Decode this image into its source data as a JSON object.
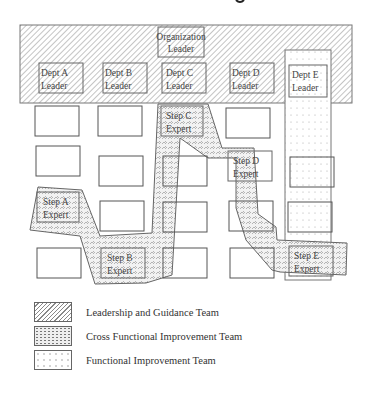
{
  "diagram": {
    "organization_leader": {
      "line1": "Organization",
      "line2": "Leader"
    },
    "dept_leaders": [
      {
        "id": "A",
        "line1": "Dept A",
        "line2": "Leader"
      },
      {
        "id": "B",
        "line1": "Dept B",
        "line2": "Leader"
      },
      {
        "id": "C",
        "line1": "Dept C",
        "line2": "Leader"
      },
      {
        "id": "D",
        "line1": "Dept D",
        "line2": "Leader"
      },
      {
        "id": "E",
        "line1": "Dept E",
        "line2": "Leader"
      }
    ],
    "step_experts": [
      {
        "id": "A",
        "line1": "Step A",
        "line2": "Expert"
      },
      {
        "id": "B",
        "line1": "Step B",
        "line2": "Expert"
      },
      {
        "id": "C",
        "line1": "Step C",
        "line2": "Expert"
      },
      {
        "id": "D",
        "line1": "Step D",
        "line2": "Expert"
      },
      {
        "id": "E",
        "line1": "Step E",
        "line2": "Expert"
      }
    ]
  },
  "legend": [
    {
      "pattern": "diagonal-hatch",
      "label": "Leadership and Guidance Team"
    },
    {
      "pattern": "cross-hatch-dots",
      "label": "Cross Functional Improvement Team"
    },
    {
      "pattern": "dotted",
      "label": "Functional Improvement Team"
    }
  ]
}
